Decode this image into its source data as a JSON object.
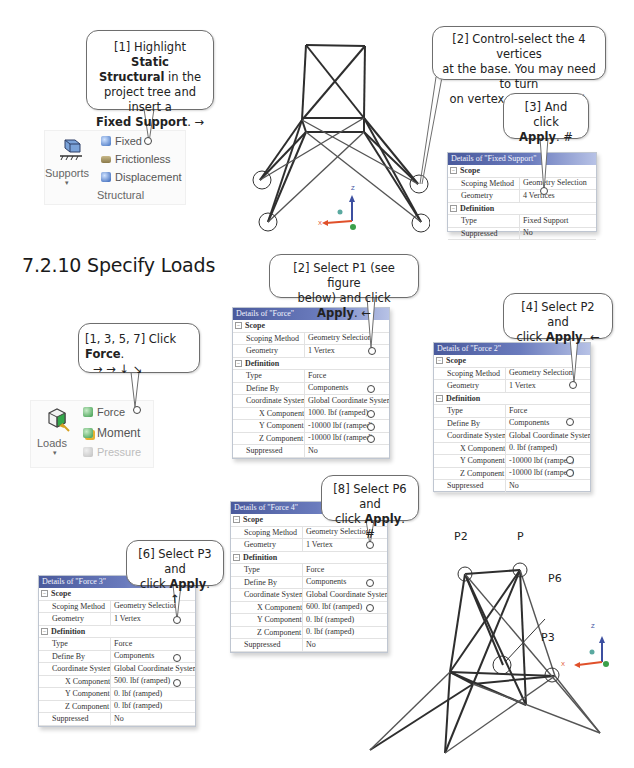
{
  "callouts": {
    "step1_supports": {
      "line1_a": "[1] Highlight ",
      "line1_b": "Static",
      "line2_a": "Structural",
      "line2_b": " in the",
      "line3": "project tree and insert a",
      "line4_a": "Fixed Support",
      "line4_b": ". →"
    },
    "step2_vertices": {
      "line1": "[2] Control-select the 4 vertices",
      "line2": "at the base. You may need to turn",
      "line3": "on vertex select filter. ↓"
    },
    "step3_apply": {
      "line1": "[3] And click",
      "line2_a": "Apply",
      "line2_b": ".  #"
    },
    "loads_click_force": {
      "line1_a": "[1, 3, 5, 7] Click ",
      "line1_b": "Force",
      "line1_c": ".",
      "line2": "→ → ↓ ↘"
    },
    "select_p1": {
      "line1": "[2] Select P1 (see figure",
      "line2_a": "below) and click ",
      "line2_b": "Apply",
      "line2_c": ". ←"
    },
    "select_p2": {
      "line1": "[4] Select P2 and",
      "line2_a": "click ",
      "line2_b": "Apply",
      "line2_c": ". ←"
    },
    "select_p6": {
      "line1": "[8] Select P6 and",
      "line2_a": "click ",
      "line2_b": "Apply",
      "line2_c": ".  #"
    },
    "select_p3": {
      "line1": "[6] Select P3 and",
      "line2_a": "click ",
      "line2_b": "Apply",
      "line2_c": ".  ↑"
    }
  },
  "section": {
    "title": "7.2.10  Specify Loads"
  },
  "supports_ribbon": {
    "big_button_label": "Supports",
    "dropdown_indicator": "▾",
    "items": [
      {
        "label": "Fixed",
        "icon": "fixed-support-icon"
      },
      {
        "label": "Frictionless",
        "icon": "frictionless-support-icon"
      },
      {
        "label": "Displacement",
        "icon": "displacement-icon"
      }
    ],
    "group_label": "Structural"
  },
  "loads_ribbon": {
    "big_button_label": "Loads",
    "dropdown_indicator": "▾",
    "items": [
      {
        "label": "Force",
        "icon": "force-icon",
        "enabled": true
      },
      {
        "label": "Moment",
        "icon": "moment-icon",
        "enabled": true
      },
      {
        "label": "Pressure",
        "icon": "pressure-icon",
        "enabled": false
      }
    ]
  },
  "details_fixed_support": {
    "title": "Details of \"Fixed Support\"",
    "scope_label": "Scope",
    "definition_label": "Definition",
    "rows_scope": [
      {
        "key": "Scoping Method",
        "value": "Geometry Selection"
      },
      {
        "key": "Geometry",
        "value": "4 Vertices"
      }
    ],
    "rows_definition": [
      {
        "key": "Type",
        "value": "Fixed Support"
      },
      {
        "key": "Suppressed",
        "value": "No"
      }
    ]
  },
  "details_force": {
    "title": "Details of \"Force\"",
    "scope_label": "Scope",
    "definition_label": "Definition",
    "scoping_method": "Geometry Selection",
    "geometry": "1 Vertex",
    "type": "Force",
    "define_by": "Components",
    "coordinate_system": "Global Coordinate System",
    "x_component": "1000. lbf  (ramped)",
    "y_component": "-10000 lbf  (ramped)",
    "z_component": "-10000 lbf  (ramped)",
    "suppressed": "No"
  },
  "details_force2": {
    "title": "Details of \"Force 2\"",
    "scope_label": "Scope",
    "definition_label": "Definition",
    "scoping_method": "Geometry Selection",
    "geometry": "1 Vertex",
    "type": "Force",
    "define_by": "Components",
    "coordinate_system": "Global Coordinate System",
    "x_component": "0. lbf  (ramped)",
    "y_component": "-10000 lbf  (ramped)",
    "z_component": "-10000 lbf  (ramped)",
    "suppressed": "No"
  },
  "details_force3": {
    "title": "Details of \"Force 3\"",
    "scope_label": "Scope",
    "definition_label": "Definition",
    "scoping_method": "Geometry Selection",
    "geometry": "1 Vertex",
    "type": "Force",
    "define_by": "Components",
    "coordinate_system": "Global Coordinate System",
    "x_component": "500. lbf  (ramped)",
    "y_component": "0. lbf  (ramped)",
    "z_component": "0. lbf  (ramped)",
    "suppressed": "No"
  },
  "details_force4": {
    "title": "Details of \"Force 4\"",
    "scope_label": "Scope",
    "definition_label": "Definition",
    "scoping_method": "Geometry Selection",
    "geometry": "1 Vertex",
    "type": "Force",
    "define_by": "Components",
    "coordinate_system": "Global Coordinate System",
    "x_component": "600. lbf  (ramped)",
    "y_component": "0. lbf  (ramped)",
    "z_component": "0. lbf  (ramped)",
    "suppressed": "No"
  },
  "row_labels": {
    "scoping_method": "Scoping Method",
    "geometry": "Geometry",
    "type": "Type",
    "define_by": "Define By",
    "coordinate_system": "Coordinate System",
    "x_component": "X Component",
    "y_component": "Y Component",
    "z_component": "Z Component",
    "suppressed": "Suppressed"
  },
  "figure_labels": {
    "p2": "P2",
    "p": "P",
    "p6": "P6",
    "p3": "P3"
  },
  "axes": {
    "x": "X",
    "y": "Y",
    "z": "Z",
    "x_color": "#e0502a",
    "y_color": "#3aa04a",
    "z_color": "#3c4fa0"
  },
  "colors": {
    "details_header_start": "#4a5a9c",
    "details_header_end": "#b7c2e6",
    "callout_border": "#6e6e6e"
  }
}
